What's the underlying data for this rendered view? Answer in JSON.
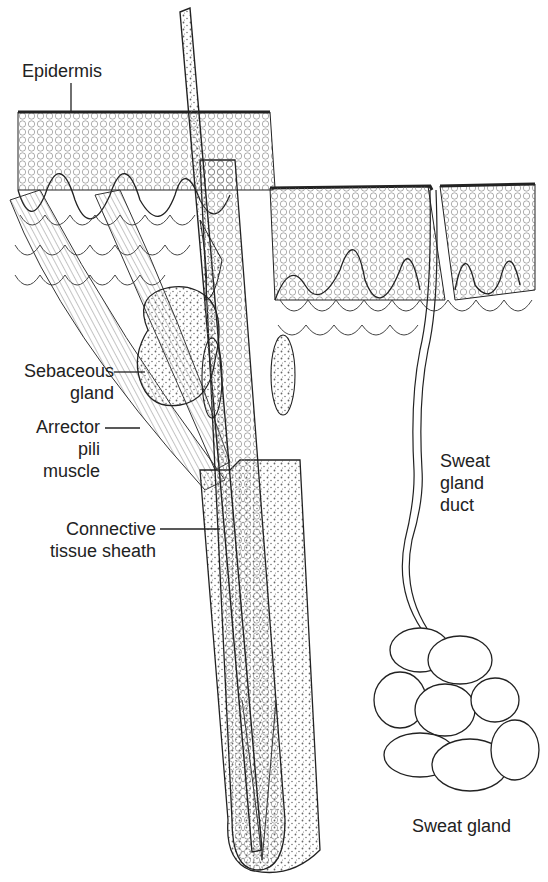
{
  "diagram": {
    "labels": {
      "epidermis": [
        "Epidermis"
      ],
      "sebaceous_gland": [
        "Sebaceous",
        "gland"
      ],
      "arrector_pili": [
        "Arrector",
        "pili",
        "muscle"
      ],
      "connective_tissue": [
        "Connective",
        "tissue sheath"
      ],
      "sweat_gland_duct": [
        "Sweat",
        "gland",
        "duct"
      ],
      "sweat_gland": [
        "Sweat gland"
      ]
    },
    "colors": {
      "ink": "#222222",
      "stipple": "#555555",
      "background": "#ffffff"
    }
  }
}
